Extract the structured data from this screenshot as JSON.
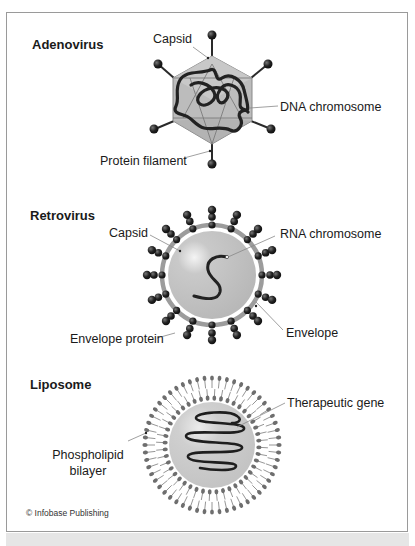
{
  "figure": {
    "credit": "© Infobase Publishing",
    "colors": {
      "frame": "#9a9a9a",
      "capsid_fill": "#bdbdbd",
      "strand": "#222222",
      "knob": "#1e1e1e",
      "envelope": "#9e9e9e",
      "leader_line": "#888888"
    }
  },
  "panels": [
    {
      "title": "Adenovirus",
      "labels": {
        "capsid": "Capsid",
        "chromosome": "DNA chromosome",
        "filament": "Protein filament"
      }
    },
    {
      "title": "Retrovirus",
      "labels": {
        "capsid": "Capsid",
        "chromosome": "RNA chromosome",
        "envelope_protein": "Envelope protein",
        "envelope": "Envelope"
      }
    },
    {
      "title": "Liposome",
      "labels": {
        "gene": "Therapeutic gene",
        "bilayer_line1": "Phospholipid",
        "bilayer_line2": "bilayer"
      }
    }
  ]
}
